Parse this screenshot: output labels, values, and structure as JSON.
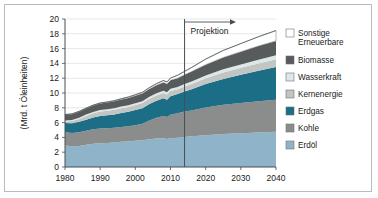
{
  "chart_data": {
    "type": "area",
    "title": "",
    "xlabel": "",
    "ylabel": "(Mrd. t Öleinheiten)",
    "xlim": [
      1980,
      2040
    ],
    "ylim": [
      0,
      20
    ],
    "yticks": [
      0,
      2,
      4,
      6,
      8,
      10,
      12,
      14,
      16,
      18,
      20
    ],
    "xticks": [
      1980,
      1990,
      2000,
      2010,
      2020,
      2030,
      2040
    ],
    "xticklabels": [
      "1980",
      "1990",
      "2000",
      "2010",
      "2020",
      "2030",
      "2040"
    ],
    "yticklabels": [
      "0",
      "2",
      "4",
      "6",
      "8",
      "10",
      "12",
      "14",
      "16",
      "18",
      "20"
    ],
    "grid": true,
    "stacked": true,
    "legend_position": "right",
    "x": [
      1980,
      1982,
      1984,
      1986,
      1988,
      1990,
      1992,
      1994,
      1996,
      1998,
      2000,
      2002,
      2004,
      2006,
      2008,
      2009,
      2010,
      2012,
      2014,
      2016,
      2020,
      2025,
      2030,
      2035,
      2040
    ],
    "series": [
      {
        "name": "Erdöl",
        "color": "#8fb4ca",
        "values": [
          2.9,
          2.8,
          2.85,
          3.0,
          3.15,
          3.2,
          3.25,
          3.3,
          3.4,
          3.45,
          3.55,
          3.6,
          3.75,
          3.85,
          3.9,
          3.8,
          3.9,
          3.95,
          4.05,
          4.15,
          4.3,
          4.45,
          4.55,
          4.65,
          4.75
        ]
      },
      {
        "name": "Kohle",
        "color": "#8b8d8c",
        "values": [
          1.8,
          1.8,
          1.85,
          1.9,
          1.95,
          2.0,
          2.0,
          2.0,
          2.0,
          2.05,
          2.1,
          2.25,
          2.55,
          2.8,
          3.0,
          2.95,
          3.15,
          3.3,
          3.45,
          3.5,
          3.75,
          3.95,
          4.1,
          4.25,
          4.35
        ]
      },
      {
        "name": "Erdgas",
        "color": "#1b6e85",
        "values": [
          1.25,
          1.3,
          1.4,
          1.5,
          1.6,
          1.7,
          1.75,
          1.8,
          1.9,
          1.95,
          2.05,
          2.1,
          2.2,
          2.3,
          2.4,
          2.35,
          2.5,
          2.6,
          2.7,
          2.85,
          3.15,
          3.5,
          3.8,
          4.1,
          4.4
        ]
      },
      {
        "name": "Kernenergie",
        "color": "#c3c5c3",
        "values": [
          0.2,
          0.3,
          0.4,
          0.5,
          0.55,
          0.6,
          0.6,
          0.62,
          0.65,
          0.67,
          0.68,
          0.69,
          0.71,
          0.72,
          0.71,
          0.7,
          0.72,
          0.65,
          0.68,
          0.72,
          0.8,
          0.88,
          0.95,
          1.0,
          1.05
        ]
      },
      {
        "name": "Wasserkraft",
        "color": "#dce7ea",
        "values": [
          0.15,
          0.16,
          0.17,
          0.18,
          0.19,
          0.2,
          0.21,
          0.22,
          0.23,
          0.24,
          0.25,
          0.26,
          0.27,
          0.28,
          0.29,
          0.29,
          0.3,
          0.31,
          0.33,
          0.35,
          0.38,
          0.42,
          0.46,
          0.5,
          0.54
        ]
      },
      {
        "name": "Biomasse",
        "color": "#585b5c",
        "values": [
          0.75,
          0.78,
          0.8,
          0.83,
          0.86,
          0.88,
          0.9,
          0.93,
          0.95,
          0.98,
          1.0,
          1.03,
          1.06,
          1.1,
          1.13,
          1.13,
          1.15,
          1.2,
          1.25,
          1.32,
          1.45,
          1.6,
          1.72,
          1.85,
          1.95
        ]
      },
      {
        "name": "Sonstige Erneuerbare",
        "color": "#ffffff",
        "values": [
          0.04,
          0.04,
          0.05,
          0.05,
          0.06,
          0.07,
          0.08,
          0.09,
          0.1,
          0.12,
          0.14,
          0.16,
          0.19,
          0.22,
          0.26,
          0.27,
          0.3,
          0.38,
          0.46,
          0.56,
          0.75,
          0.95,
          1.1,
          1.25,
          1.4
        ]
      }
    ],
    "annotations": [
      {
        "text": "Projektion",
        "x": 2014,
        "type": "divider-label"
      }
    ]
  },
  "legend": {
    "items": [
      {
        "label": "Sonstige",
        "label2": "Erneuerbare",
        "color": "#ffffff"
      },
      {
        "label": "Biomasse",
        "label2": "",
        "color": "#585b5c"
      },
      {
        "label": "Wasserkraft",
        "label2": "",
        "color": "#dce7ea"
      },
      {
        "label": "Kernenergie",
        "label2": "",
        "color": "#c3c5c3"
      },
      {
        "label": "Erdgas",
        "label2": "",
        "color": "#1b6e85"
      },
      {
        "label": "Kohle",
        "label2": "",
        "color": "#8b8d8c"
      },
      {
        "label": "Erdöl",
        "label2": "",
        "color": "#8fb4ca"
      }
    ]
  },
  "annotation": {
    "projektion_label": "Projektion"
  },
  "colors": {
    "frame": "#b9bcbe",
    "grid": "#d4d7d9",
    "axis": "#4a4d50",
    "text": "#1a1a1a"
  }
}
